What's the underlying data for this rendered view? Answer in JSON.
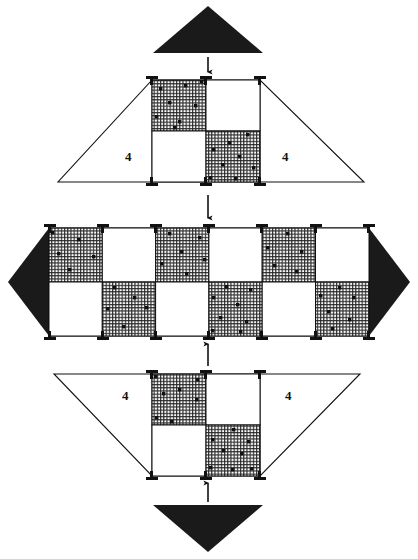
{
  "figure": {
    "title": "Checkerboard modular plan diagram",
    "background_color": "#ffffff",
    "ink_color": "#111111",
    "solid_fill_color": "#1a1a1a",
    "hatch_fill_color": "#2b2b2b",
    "white_fill_color": "#ffffff",
    "width": 418,
    "height": 559
  },
  "labels": {
    "top_left_quantity": "4",
    "top_right_quantity": "4",
    "bottom_left_quantity": "4",
    "bottom_right_quantity": "4"
  },
  "sections": [
    {
      "id": "top-triangle",
      "name": "solid-triangle-up",
      "shape": "triangle",
      "direction": "down",
      "fill": "solid",
      "apex": [
        208,
        6
      ],
      "base_left": [
        153,
        53
      ],
      "base_right": [
        263,
        53
      ]
    },
    {
      "id": "top-trapezoid",
      "name": "upper-trapezoid-plan",
      "shape": "trapezoid",
      "orientation": "wide-bottom",
      "grid_rows": 2,
      "grid_cols": 2,
      "tiles": [
        [
          "hatched",
          "white"
        ],
        [
          "white",
          "hatched"
        ]
      ],
      "quantity_labels": [
        "4",
        "4"
      ]
    },
    {
      "id": "middle-band",
      "name": "central-checkerboard-band",
      "shape": "band-with-arrowheads",
      "grid_rows": 2,
      "grid_cols": 6,
      "tiles": [
        [
          "hatched",
          "white",
          "hatched",
          "white",
          "hatched",
          "white"
        ],
        [
          "white",
          "hatched",
          "white",
          "hatched",
          "white",
          "hatched"
        ]
      ],
      "left_arrow": "solid-arrow-left",
      "right_arrow": "solid-arrow-right"
    },
    {
      "id": "bottom-trapezoid",
      "name": "lower-trapezoid-plan",
      "shape": "trapezoid",
      "orientation": "wide-top",
      "grid_rows": 2,
      "grid_cols": 2,
      "tiles": [
        [
          "hatched",
          "white"
        ],
        [
          "white",
          "hatched"
        ]
      ],
      "quantity_labels": [
        "4",
        "4"
      ]
    },
    {
      "id": "bottom-triangle",
      "name": "solid-triangle-down",
      "shape": "triangle",
      "direction": "up",
      "fill": "solid",
      "apex": [
        208,
        552
      ],
      "base_left": [
        153,
        505
      ],
      "base_right": [
        263,
        505
      ]
    }
  ],
  "arrows": [
    {
      "id": "arrow-top",
      "name": "flow-arrow-down-top",
      "direction": "down",
      "from": [
        208,
        57
      ],
      "to": [
        208,
        76
      ]
    },
    {
      "id": "arrow-upper-mid",
      "name": "flow-arrow-down-middle",
      "direction": "down",
      "from": [
        208,
        196
      ],
      "to": [
        208,
        222
      ]
    },
    {
      "id": "arrow-lower-mid",
      "name": "flow-arrow-up-middle",
      "direction": "up",
      "from": [
        208,
        364
      ],
      "to": [
        208,
        340
      ]
    },
    {
      "id": "arrow-bottom",
      "name": "flow-arrow-up-bottom",
      "direction": "up",
      "from": [
        208,
        503
      ],
      "to": [
        208,
        479
      ]
    }
  ],
  "legend": {
    "hatched_meaning": "grid-hatched module",
    "white_meaning": "open module",
    "solid_meaning": "solid directional wedge"
  }
}
